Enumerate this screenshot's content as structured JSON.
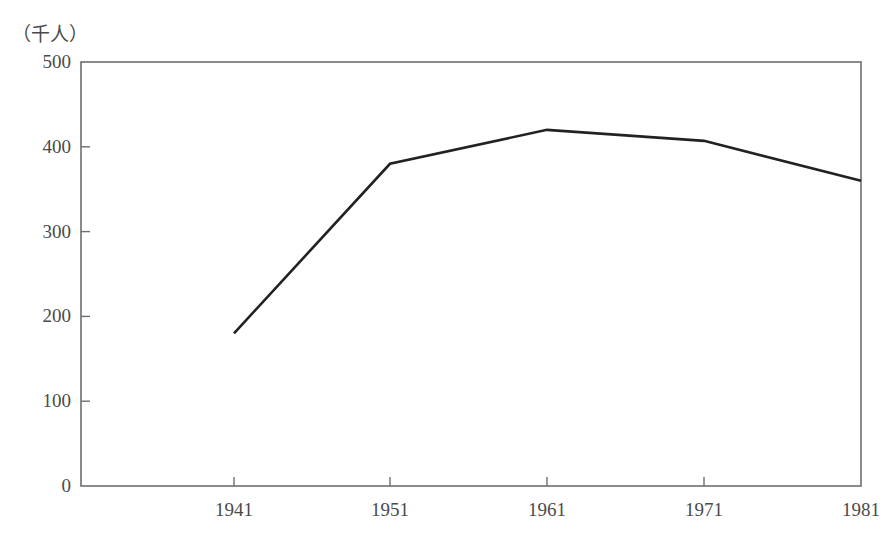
{
  "chart_data": {
    "type": "line",
    "title": "",
    "subtitle": "",
    "xlabel": "",
    "ylabel": "",
    "unit_label": "（千人）",
    "categories": [
      "1941",
      "1951",
      "1961",
      "1971",
      "1981"
    ],
    "x": [
      1941,
      1951,
      1961,
      1971,
      1981
    ],
    "values": [
      180,
      380,
      420,
      407,
      360
    ],
    "series": [
      {
        "name": "",
        "values": [
          180,
          380,
          420,
          407,
          360
        ],
        "color": "#222222"
      }
    ],
    "xlim": [
      1936,
      1981
    ],
    "ylim": [
      0,
      500
    ],
    "yticks": [
      0,
      100,
      200,
      300,
      400,
      500
    ],
    "ytick_labels": [
      "0",
      "100",
      "200",
      "300",
      "400",
      "500"
    ],
    "xticks": [
      1941,
      1951,
      1961,
      1971,
      1981
    ],
    "xtick_labels": [
      "1941",
      "1951",
      "1961",
      "1971",
      "1981"
    ],
    "grid": false,
    "legend": false,
    "legend_position": "none",
    "tick_direction": "in",
    "axis_box": true,
    "background_color": "#ffffff",
    "axis_color": "#6e6e6e",
    "text_color": "#4a4a4a"
  },
  "geometry": {
    "plot_left": 81,
    "plot_right": 861,
    "plot_top": 62,
    "plot_bottom": 486,
    "x_pixels": [
      234,
      390,
      547,
      704,
      861
    ],
    "y_pixels_for_yticks": [
      486,
      401,
      316,
      232,
      147,
      62
    ]
  }
}
